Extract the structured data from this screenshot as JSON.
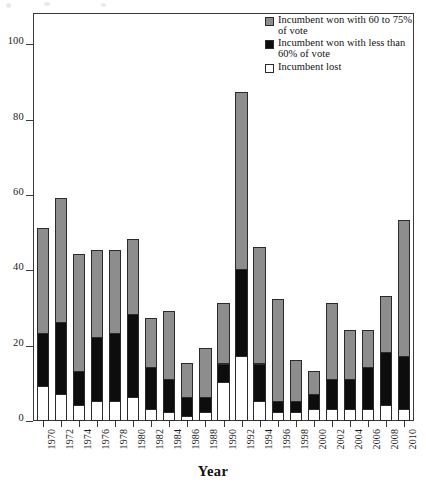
{
  "chart_data": {
    "type": "bar",
    "subtype": "stacked-bar",
    "title": "",
    "xlabel": "Year",
    "ylabel": "",
    "ylim": [
      0,
      108
    ],
    "yticks": [
      0,
      20,
      40,
      60,
      80,
      100
    ],
    "grid": false,
    "legend_position": "top-right",
    "categories": [
      "1970",
      "1972",
      "1974",
      "1976",
      "1978",
      "1980",
      "1982",
      "1984",
      "1986",
      "1988",
      "1990",
      "1992",
      "1994",
      "1996",
      "1998",
      "2000",
      "2002",
      "2004",
      "2006",
      "2008",
      "2010"
    ],
    "series": [
      {
        "name": "Incumbent lost",
        "color": "#ffffff",
        "values": [
          9,
          7,
          4,
          5,
          5,
          6,
          3,
          2,
          1,
          2,
          10,
          17,
          5,
          2,
          2,
          3,
          3,
          3,
          3,
          4,
          3
        ]
      },
      {
        "name": "Incumbent won with less than 60% of vote",
        "color": "#0d0d0d",
        "values": [
          14,
          19,
          9,
          17,
          18,
          22,
          11,
          9,
          5,
          4,
          5,
          23,
          10,
          3,
          3,
          4,
          8,
          8,
          11,
          14,
          14
        ]
      },
      {
        "name": "Incumbent won with 60 to 75% of vote",
        "color": "#8d8d8d",
        "values": [
          28,
          33,
          31,
          23,
          22,
          20,
          13,
          18,
          9,
          13,
          16,
          47,
          31,
          27,
          11,
          6,
          20,
          13,
          10,
          15,
          36
        ]
      }
    ],
    "totals": [
      51,
      59,
      44,
      45,
      45,
      48,
      27,
      29,
      15,
      19,
      31,
      87,
      46,
      32,
      16,
      13,
      31,
      24,
      24,
      33,
      53
    ]
  },
  "legend": {
    "entries": [
      {
        "swatch": "grey",
        "label": "Incumbent won with 60 to 75% of vote"
      },
      {
        "swatch": "black",
        "label": "Incumbent won with less than 60% of vote"
      },
      {
        "swatch": "white",
        "label": "Incumbent lost"
      }
    ]
  },
  "axes": {
    "x_title": "Year"
  }
}
